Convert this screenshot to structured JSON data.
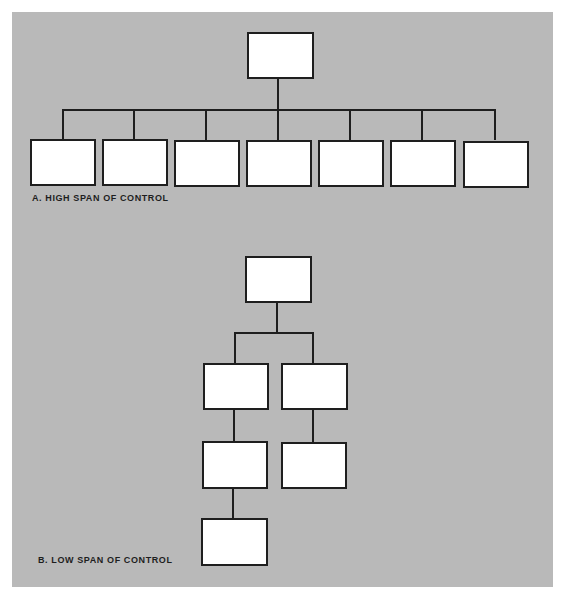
{
  "diagram": {
    "background_color": "#b9b9b9",
    "box_color": "#ffffff",
    "line_color": "#1e1e1e",
    "part_a": {
      "caption": "A.  HIGH SPAN OF CONTROL",
      "root": {
        "label": ""
      },
      "children": [
        {
          "label": ""
        },
        {
          "label": ""
        },
        {
          "label": ""
        },
        {
          "label": ""
        },
        {
          "label": ""
        },
        {
          "label": ""
        },
        {
          "label": ""
        }
      ]
    },
    "part_b": {
      "caption": "B.  LOW SPAN OF CONTROL",
      "root": {
        "label": ""
      },
      "left_chain": [
        {
          "label": ""
        },
        {
          "label": ""
        },
        {
          "label": ""
        }
      ],
      "right_chain": [
        {
          "label": ""
        },
        {
          "label": ""
        }
      ]
    }
  }
}
